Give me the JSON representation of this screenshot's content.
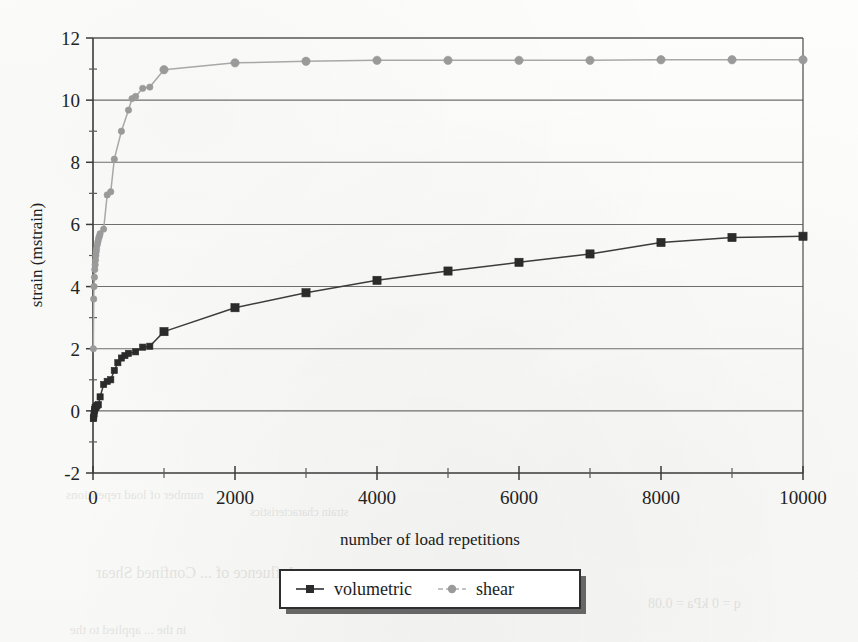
{
  "figure": {
    "background_color": "#fdfdfc",
    "plot_area": {
      "left": 93,
      "right": 803,
      "top": 38,
      "bottom": 473
    }
  },
  "chart_data": {
    "type": "line",
    "title": "",
    "subtitle": "",
    "xlabel": "number of load repetitions",
    "ylabel": "strain (mstrain)",
    "xlim": [
      0,
      10000
    ],
    "ylim": [
      -2,
      12
    ],
    "x_major_ticks": [
      0,
      2000,
      4000,
      6000,
      8000,
      10000
    ],
    "x_minor_ticks": [
      1000,
      3000,
      5000,
      7000,
      9000
    ],
    "x_tick_labels": [
      "0",
      "2000",
      "4000",
      "6000",
      "8000",
      "10000"
    ],
    "y_major_ticks": [
      -2,
      0,
      2,
      4,
      6,
      8,
      10,
      12
    ],
    "y_minor_ticks": [
      -1,
      1,
      3,
      5,
      7,
      9,
      11
    ],
    "y_tick_labels": [
      "-2",
      "0",
      "2",
      "4",
      "6",
      "8",
      "10",
      "12"
    ],
    "grid": {
      "horizontal": true,
      "vertical": false,
      "color": "#6e6e6e"
    },
    "legend": {
      "position": "bottom-center",
      "entries": [
        "volumetric",
        "shear"
      ]
    },
    "series": [
      {
        "name": "volumetric",
        "color": "#3c3c3c",
        "marker": "square",
        "marker_color": "#2b2b2b",
        "points": [
          [
            5,
            -0.25
          ],
          [
            10,
            -0.2
          ],
          [
            15,
            -0.1
          ],
          [
            20,
            0.0
          ],
          [
            25,
            0.05
          ],
          [
            30,
            0.1
          ],
          [
            40,
            0.12
          ],
          [
            50,
            0.15
          ],
          [
            60,
            0.18
          ],
          [
            75,
            0.2
          ],
          [
            100,
            0.45
          ],
          [
            150,
            0.85
          ],
          [
            200,
            0.95
          ],
          [
            250,
            1.0
          ],
          [
            300,
            1.3
          ],
          [
            350,
            1.55
          ],
          [
            400,
            1.7
          ],
          [
            450,
            1.78
          ],
          [
            500,
            1.85
          ],
          [
            600,
            1.9
          ],
          [
            700,
            2.05
          ],
          [
            800,
            2.08
          ],
          [
            1000,
            2.55
          ],
          [
            2000,
            3.32
          ],
          [
            3000,
            3.8
          ],
          [
            4000,
            4.2
          ],
          [
            5000,
            4.5
          ],
          [
            6000,
            4.78
          ],
          [
            7000,
            5.05
          ],
          [
            8000,
            5.42
          ],
          [
            9000,
            5.58
          ],
          [
            10000,
            5.62
          ]
        ]
      },
      {
        "name": "shear",
        "color": "#a8a8a8",
        "marker": "circle",
        "marker_color": "#9a9a9a",
        "points": [
          [
            5,
            2.0
          ],
          [
            10,
            3.6
          ],
          [
            15,
            4.0
          ],
          [
            20,
            4.3
          ],
          [
            25,
            4.55
          ],
          [
            30,
            4.7
          ],
          [
            35,
            4.85
          ],
          [
            40,
            5.0
          ],
          [
            45,
            5.12
          ],
          [
            50,
            5.22
          ],
          [
            60,
            5.35
          ],
          [
            70,
            5.45
          ],
          [
            80,
            5.55
          ],
          [
            90,
            5.62
          ],
          [
            100,
            5.7
          ],
          [
            150,
            5.85
          ],
          [
            200,
            6.95
          ],
          [
            250,
            7.05
          ],
          [
            300,
            8.1
          ],
          [
            400,
            9.0
          ],
          [
            500,
            9.68
          ],
          [
            550,
            10.05
          ],
          [
            600,
            10.12
          ],
          [
            700,
            10.38
          ],
          [
            800,
            10.42
          ],
          [
            1000,
            10.98
          ],
          [
            2000,
            11.2
          ],
          [
            3000,
            11.25
          ],
          [
            4000,
            11.28
          ],
          [
            5000,
            11.28
          ],
          [
            6000,
            11.28
          ],
          [
            7000,
            11.28
          ],
          [
            8000,
            11.3
          ],
          [
            9000,
            11.3
          ],
          [
            10000,
            11.3
          ]
        ]
      }
    ]
  },
  "legend": {
    "items": [
      {
        "label": "volumetric",
        "marker": "square",
        "color": "#2b2b2b",
        "line_color": "#3c3c3c"
      },
      {
        "label": "shear",
        "marker": "circle",
        "color": "#9a9a9a",
        "line_color": "#b0b0b0"
      }
    ]
  },
  "page_bleed": [
    {
      "text": "number of load repetitions",
      "x": 66,
      "y": 487,
      "size": 13
    },
    {
      "text": "strain characteristics",
      "x": 250,
      "y": 505,
      "size": 12
    },
    {
      "text": "Influence of ... Confined Shear",
      "x": 96,
      "y": 564,
      "size": 16
    },
    {
      "text": "q = 0 kPa = 0.08",
      "x": 648,
      "y": 596,
      "size": 14
    },
    {
      "text": "in the ... applied to the",
      "x": 70,
      "y": 622,
      "size": 13
    }
  ]
}
